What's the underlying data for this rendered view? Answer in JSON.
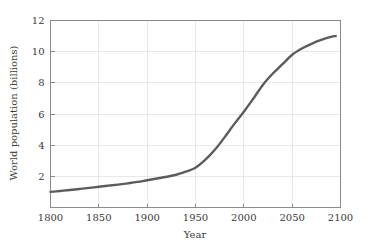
{
  "chart_data": {
    "type": "line",
    "title": "",
    "subtitle": "",
    "xlabel": "Year",
    "ylabel": "World population (billions)",
    "xlim": [
      1800,
      2100
    ],
    "ylim": [
      0,
      12
    ],
    "xticks": [
      1800,
      1850,
      1900,
      1950,
      2000,
      2050,
      2100
    ],
    "xticklabels": [
      "1800",
      "1850",
      "1900",
      "1950",
      "2000",
      "2050",
      "2100"
    ],
    "yticks": [
      2,
      4,
      6,
      8,
      10,
      12
    ],
    "yticklabels": [
      "2",
      "4",
      "6",
      "8",
      "10",
      "12"
    ],
    "grid": true,
    "legend": false,
    "line_color": "#5c5c5c",
    "series": [
      {
        "name": "World population",
        "x": [
          1800,
          1810,
          1820,
          1830,
          1840,
          1850,
          1860,
          1870,
          1880,
          1890,
          1900,
          1910,
          1920,
          1930,
          1940,
          1950,
          1960,
          1970,
          1980,
          1990,
          2000,
          2010,
          2020,
          2030,
          2040,
          2050,
          2060,
          2070,
          2080,
          2090,
          2095
        ],
        "y": [
          1.0,
          1.06,
          1.12,
          1.19,
          1.26,
          1.33,
          1.4,
          1.47,
          1.55,
          1.64,
          1.75,
          1.86,
          1.97,
          2.1,
          2.3,
          2.55,
          3.05,
          3.7,
          4.5,
          5.35,
          6.15,
          7.0,
          7.9,
          8.6,
          9.2,
          9.8,
          10.2,
          10.5,
          10.75,
          10.95,
          11.0
        ]
      }
    ]
  }
}
